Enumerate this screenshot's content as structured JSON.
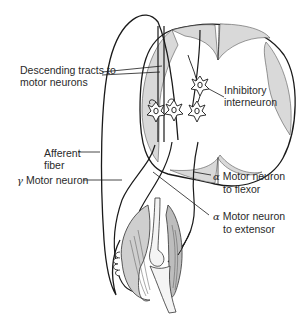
{
  "diagram": {
    "colors": {
      "line": "#1a1a1a",
      "gray_matter": "#d9d9d9",
      "muscle_shade": "#bdbdbd",
      "background": "#ffffff",
      "text": "#2a2a2a"
    },
    "labels": {
      "descending_tracts": {
        "line1": "Descending tracts to",
        "line2": "motor neurons"
      },
      "inhibitory_interneuron": {
        "line1": "Inhibitory",
        "line2": "interneuron"
      },
      "afferent_fiber": {
        "line1": "Afferent",
        "line2": "fiber"
      },
      "gamma_motor_neuron": {
        "symbol": "γ",
        "text": "Motor neuron"
      },
      "alpha_flexor": {
        "symbol": "α",
        "line1": "Motor neuron",
        "line2": "to flexor"
      },
      "alpha_extensor": {
        "symbol": "α",
        "line1": "Motor neuron",
        "line2": "to extensor"
      }
    }
  }
}
